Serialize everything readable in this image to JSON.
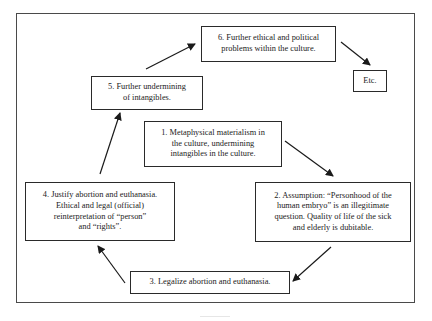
{
  "diagram": {
    "type": "cycle-flowchart",
    "nodes": [
      {
        "id": "n1",
        "label": "1. Metaphysical materialism in the culture, undermining intangibles in the culture.",
        "lines": [
          "1. Metaphysical materialism in",
          "the culture, undermining",
          "intangibles in the culture."
        ]
      },
      {
        "id": "n2",
        "label": "2. Assumption: “Personhood of the human embryo” is an illegitimate question. Quality of life of the sick and elderly is dubitable.",
        "lines": [
          "2. Assumption: “Personhood of the",
          "human embryo” is an illegitimate",
          "question. Quality of life of the sick",
          "and elderly is dubitable."
        ]
      },
      {
        "id": "n3",
        "label": "3. Legalize abortion and euthanasia.",
        "lines": [
          "3. Legalize abortion and euthanasia."
        ]
      },
      {
        "id": "n4",
        "label": "4. Justify abortion and euthanasia. Ethical and legal (official) reinterpretation of “person” and “rights”.",
        "lines": [
          "4. Justify abortion and euthanasia.",
          "Ethical and legal (official)",
          "reinterpretation of  “person”",
          "and “rights”."
        ]
      },
      {
        "id": "n5",
        "label": "5. Further undermining of intangibles.",
        "lines": [
          "5. Further undermining",
          "of intangibles."
        ]
      },
      {
        "id": "n6",
        "label": "6. Further ethical and political problems within the culture.",
        "lines": [
          "6. Further ethical and political",
          "problems within the culture."
        ]
      },
      {
        "id": "etc",
        "label": "Etc.",
        "lines": [
          "Etc."
        ]
      }
    ],
    "edges": [
      {
        "from": "n1",
        "to": "n2"
      },
      {
        "from": "n2",
        "to": "n3"
      },
      {
        "from": "n3",
        "to": "n4"
      },
      {
        "from": "n4",
        "to": "n5"
      },
      {
        "from": "n5",
        "to": "n6"
      },
      {
        "from": "n6",
        "to": "etc"
      }
    ],
    "colors": {
      "stroke": "#2a2a2a",
      "frame": "#4a4a4a",
      "background": "#ffffff",
      "text": "#222222"
    }
  }
}
